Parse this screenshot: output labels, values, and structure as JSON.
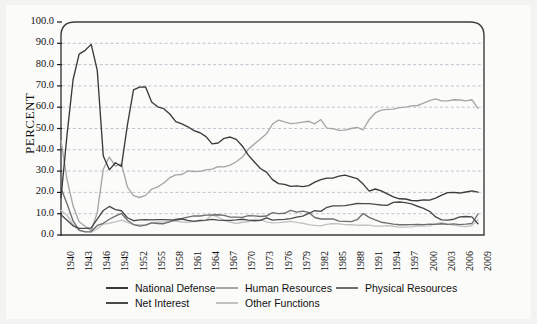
{
  "chart_data": {
    "type": "line",
    "title": "",
    "xlabel": "",
    "ylabel": "PERCENT",
    "ylim": [
      0.0,
      100.0
    ],
    "xlim": [
      1940,
      2010
    ],
    "grid": true,
    "grid_style": "dashed-horizontal",
    "legend_position": "bottom",
    "ytick_labels": [
      "100.0",
      "90.0",
      "80.0",
      "70.0",
      "60.0",
      "50.0",
      "40.0",
      "30.0",
      "20.0",
      "10.0",
      "0.0"
    ],
    "ytick_values": [
      100.0,
      90.0,
      80.0,
      70.0,
      60.0,
      50.0,
      40.0,
      30.0,
      20.0,
      10.0,
      0.0
    ],
    "xtick_labels": [
      "1940",
      "1943",
      "1946",
      "1949",
      "1952",
      "1955",
      "1958",
      "1961",
      "1964",
      "1967",
      "1970",
      "1973",
      "1976",
      "1979",
      "1982",
      "1985",
      "1988",
      "1991",
      "1994",
      "1997",
      "2000",
      "2003",
      "2006",
      "2009"
    ],
    "xtick_values": [
      1940,
      1943,
      1946,
      1949,
      1952,
      1955,
      1958,
      1961,
      1964,
      1967,
      1970,
      1973,
      1976,
      1979,
      1982,
      1985,
      1988,
      1991,
      1994,
      1997,
      2000,
      2003,
      2006,
      2009
    ],
    "x": [
      1940,
      1941,
      1942,
      1943,
      1944,
      1945,
      1946,
      1947,
      1948,
      1949,
      1950,
      1951,
      1952,
      1953,
      1954,
      1955,
      1956,
      1957,
      1958,
      1959,
      1960,
      1961,
      1962,
      1963,
      1964,
      1965,
      1966,
      1967,
      1968,
      1969,
      1970,
      1971,
      1972,
      1973,
      1974,
      1975,
      1976,
      1977,
      1978,
      1979,
      1980,
      1981,
      1982,
      1983,
      1984,
      1985,
      1986,
      1987,
      1988,
      1989,
      1990,
      1991,
      1992,
      1993,
      1994,
      1995,
      1996,
      1997,
      1998,
      1999,
      2000,
      2001,
      2002,
      2003,
      2004,
      2005,
      2006,
      2007,
      2008,
      2009
    ],
    "series": [
      {
        "name": "National Defense",
        "color": "#3a3a3a",
        "values": [
          17.5,
          47.1,
          73.0,
          84.9,
          86.7,
          89.5,
          77.3,
          37.1,
          30.6,
          33.9,
          32.2,
          51.8,
          68.1,
          69.4,
          69.5,
          62.4,
          60.2,
          59.3,
          56.8,
          53.2,
          52.2,
          50.8,
          49.0,
          48.0,
          46.2,
          42.8,
          43.2,
          45.4,
          46.0,
          44.9,
          41.8,
          37.5,
          34.3,
          31.2,
          29.5,
          26.0,
          24.1,
          23.8,
          22.8,
          23.1,
          22.7,
          23.2,
          24.8,
          26.0,
          26.7,
          26.7,
          27.6,
          28.1,
          27.3,
          26.5,
          23.9,
          20.6,
          21.6,
          20.7,
          19.3,
          17.9,
          17.0,
          16.9,
          16.2,
          16.1,
          16.5,
          16.4,
          17.3,
          18.7,
          19.9,
          20.0,
          19.7,
          20.2,
          20.7,
          20.1
        ]
      },
      {
        "name": "Human Resources",
        "color": "#a6a6a6",
        "values": [
          44.3,
          26.0,
          13.6,
          6.2,
          4.1,
          2.0,
          10.5,
          30.9,
          36.6,
          32.3,
          33.4,
          22.5,
          18.5,
          17.6,
          18.6,
          21.5,
          22.6,
          24.4,
          26.9,
          28.2,
          28.4,
          30.1,
          29.8,
          29.9,
          30.6,
          30.9,
          32.1,
          32.0,
          32.8,
          34.4,
          36.5,
          40.2,
          42.7,
          45.1,
          47.5,
          52.1,
          53.9,
          53.1,
          52.3,
          52.5,
          53.0,
          53.4,
          52.2,
          54.2,
          50.2,
          49.9,
          49.1,
          49.2,
          50.0,
          50.5,
          49.4,
          54.2,
          57.3,
          58.6,
          59.0,
          59.1,
          59.8,
          60.0,
          60.6,
          60.8,
          61.9,
          63.1,
          63.9,
          63.0,
          63.0,
          63.5,
          63.4,
          63.0,
          63.5,
          59.5
        ]
      },
      {
        "name": "Physical Resources",
        "color": "#6e6e6e",
        "values": [
          22.0,
          14.7,
          6.6,
          2.3,
          1.5,
          1.6,
          4.5,
          5.5,
          7.4,
          8.9,
          10.1,
          6.9,
          4.9,
          4.2,
          4.6,
          5.7,
          5.4,
          5.3,
          6.2,
          7.4,
          7.8,
          8.4,
          9.0,
          8.9,
          9.3,
          9.4,
          9.5,
          9.2,
          8.4,
          8.4,
          8.3,
          9.1,
          9.0,
          8.7,
          8.9,
          10.5,
          10.0,
          10.2,
          11.6,
          10.7,
          11.2,
          10.6,
          8.2,
          7.5,
          7.5,
          7.6,
          6.5,
          6.4,
          6.3,
          7.2,
          10.1,
          8.3,
          7.1,
          6.0,
          5.6,
          5.1,
          4.8,
          4.8,
          4.9,
          5.0,
          4.9,
          5.1,
          5.0,
          5.3,
          5.0,
          5.2,
          4.9,
          5.1,
          5.4,
          9.8
        ]
      },
      {
        "name": "Net Interest",
        "color": "#4a4a4a",
        "values": [
          9.5,
          6.9,
          4.3,
          3.1,
          3.1,
          3.3,
          7.5,
          11.5,
          13.4,
          11.9,
          11.4,
          8.1,
          6.7,
          7.1,
          7.2,
          7.1,
          7.2,
          7.2,
          7.1,
          7.0,
          7.5,
          6.9,
          6.4,
          6.9,
          7.0,
          7.3,
          7.0,
          6.9,
          6.9,
          7.1,
          7.4,
          7.0,
          6.7,
          6.9,
          8.0,
          7.0,
          7.2,
          7.3,
          7.7,
          8.4,
          8.9,
          10.1,
          11.4,
          11.1,
          13.0,
          13.7,
          13.7,
          13.8,
          14.3,
          14.8,
          14.7,
          14.7,
          14.4,
          14.1,
          13.9,
          15.3,
          15.5,
          15.2,
          14.6,
          13.5,
          12.5,
          11.1,
          8.5,
          7.1,
          7.0,
          7.4,
          8.5,
          8.7,
          8.5,
          5.3
        ]
      },
      {
        "name": "Other Functions",
        "color": "#c2c2c2",
        "values": [
          11.6,
          9.3,
          4.9,
          2.1,
          1.6,
          1.3,
          2.9,
          5.1,
          5.5,
          6.2,
          7.0,
          5.9,
          4.9,
          4.8,
          4.7,
          5.8,
          6.0,
          6.1,
          6.4,
          6.5,
          6.1,
          6.0,
          6.4,
          6.4,
          6.9,
          9.5,
          8.4,
          6.8,
          6.1,
          5.4,
          6.0,
          6.2,
          7.3,
          7.2,
          6.2,
          5.7,
          5.8,
          6.1,
          6.4,
          5.9,
          5.5,
          4.9,
          4.5,
          4.3,
          5.0,
          5.4,
          5.2,
          4.9,
          4.8,
          4.6,
          4.6,
          4.6,
          4.2,
          4.2,
          4.4,
          4.1,
          3.7,
          3.7,
          3.8,
          4.3,
          4.2,
          4.3,
          5.3,
          5.8,
          5.1,
          4.6,
          4.2,
          3.9,
          4.4,
          7.2
        ]
      }
    ],
    "legend": [
      {
        "label": "National Defense",
        "color": "#3a3a3a"
      },
      {
        "label": "Human Resources",
        "color": "#a6a6a6"
      },
      {
        "label": "Physical Resources",
        "color": "#6e6e6e"
      },
      {
        "label": "Net Interest",
        "color": "#4a4a4a"
      },
      {
        "label": "Other Functions",
        "color": "#c2c2c2"
      }
    ]
  }
}
